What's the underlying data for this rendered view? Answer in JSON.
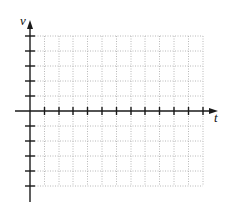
{
  "diagram": {
    "type": "blank-coordinate-grid",
    "vertical_axis": {
      "label": "v",
      "ticks_above_origin": 5,
      "ticks_below_origin": 5
    },
    "horizontal_axis": {
      "label": "t",
      "ticks_right_of_origin": 12
    },
    "grid": {
      "columns": 12,
      "rows_above_axis": 5,
      "rows_below_axis": 5,
      "line_style": "dotted",
      "line_color": "#b8b8b8"
    },
    "colors": {
      "axis": "#1a1a1a",
      "background": "#ffffff"
    }
  }
}
